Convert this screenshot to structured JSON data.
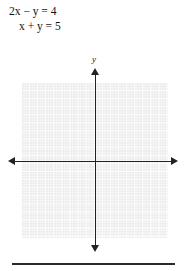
{
  "problem": {
    "equations": [
      "2x − y = 4",
      "x + y = 5"
    ]
  },
  "graph": {
    "y_axis_label": "y",
    "x_axis_label": "",
    "grid": {
      "visible": true,
      "color": "#ebebeb",
      "minor_line_color": "#f6f6f6",
      "major_line_color": "#fdfdfd"
    },
    "axis_color": "#222222",
    "x_axis_arrows": [
      "left",
      "right"
    ],
    "y_axis_arrows": [
      "up",
      "down"
    ]
  },
  "chart_data": {
    "type": "line",
    "title": "",
    "xlabel": "",
    "ylabel": "y",
    "grid": true,
    "legend": "none",
    "xlim": [
      -9,
      9
    ],
    "ylim": [
      -9,
      10
    ],
    "annotations": [
      "2x − y = 4",
      "x + y = 5"
    ],
    "series": [],
    "note": "Blank coordinate grid with x- and y-axes drawn; no curves plotted."
  },
  "footer": {
    "rule_color": "#2b2b2b"
  }
}
